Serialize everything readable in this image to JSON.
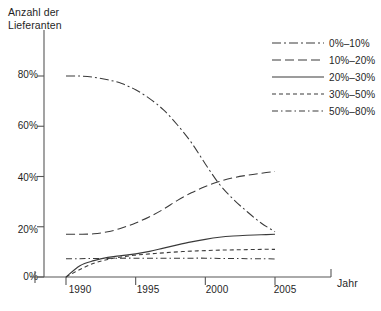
{
  "chart_data": {
    "type": "line",
    "title": "",
    "ylabel": "Anzahl der Lieferanten",
    "ylabel_line1": "Anzahl der",
    "ylabel_line2": "Lieferanten",
    "xlabel": "Jahr",
    "x": [
      1990,
      1991,
      1992,
      1993,
      1994,
      1995,
      1996,
      1997,
      1998,
      1999,
      2000,
      2001,
      2002,
      2003,
      2004,
      2005
    ],
    "xlim": [
      1989,
      2006.5
    ],
    "ylim": [
      0,
      92
    ],
    "grid": false,
    "legend_position": "top-right",
    "xtick_labels": [
      "1990",
      "1995",
      "2000",
      "2005"
    ],
    "xticks": [
      1990,
      1995,
      2000,
      2005
    ],
    "ytick_labels": [
      "0%",
      "20%",
      "40%",
      "60%",
      "80%"
    ],
    "yticks": [
      0,
      20,
      40,
      60,
      80
    ],
    "series": [
      {
        "name": "0%–10%",
        "style": "dashdot",
        "color": "#3a3a3a",
        "values": [
          80,
          80,
          79.5,
          78.5,
          77,
          74.5,
          71,
          66.5,
          60.5,
          53.5,
          45,
          37,
          31,
          26,
          21.5,
          18
        ]
      },
      {
        "name": "10%–20%",
        "style": "dash-long",
        "color": "#3a3a3a",
        "values": [
          17,
          17,
          17.2,
          18,
          19.5,
          21.5,
          24,
          27,
          30.5,
          33.5,
          36,
          38,
          39.5,
          40.5,
          41.3,
          42
        ]
      },
      {
        "name": "20%–30%",
        "style": "solid",
        "color": "#3a3a3a",
        "values": [
          0,
          4.5,
          6.5,
          7.8,
          8.5,
          9.2,
          10.2,
          11.5,
          12.8,
          14,
          15,
          15.8,
          16.3,
          16.6,
          16.8,
          17
        ]
      },
      {
        "name": "30%–50%",
        "style": "dash-fine",
        "color": "#3a3a3a",
        "values": [
          0,
          3,
          5.5,
          7,
          8,
          8.7,
          9.2,
          9.6,
          10,
          10.3,
          10.5,
          10.7,
          10.8,
          10.9,
          11,
          11
        ]
      },
      {
        "name": "50%–80%",
        "style": "dashdot-fine",
        "color": "#3a3a3a",
        "values": [
          7.3,
          7.3,
          7.4,
          7.4,
          7.5,
          7.5,
          7.5,
          7.5,
          7.5,
          7.5,
          7.5,
          7.4,
          7.4,
          7.3,
          7.3,
          7.2
        ]
      }
    ]
  },
  "legend": {
    "items": [
      {
        "label": "0%–10%"
      },
      {
        "label": "10%–20%"
      },
      {
        "label": "20%–30%"
      },
      {
        "label": "30%–50%"
      },
      {
        "label": "50%–80%"
      }
    ]
  },
  "axes": {
    "y_title_line1": "Anzahl der",
    "y_title_line2": "Lieferanten",
    "x_title": "Jahr",
    "y_ticks": [
      "80%",
      "60%",
      "40%",
      "20%",
      "0%"
    ],
    "x_ticks": [
      "1990",
      "1995",
      "2000",
      "2005"
    ]
  }
}
